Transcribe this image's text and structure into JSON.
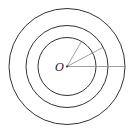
{
  "diagram": {
    "title": "",
    "center_label": "O",
    "center": {
      "x": 67,
      "y": 66.5
    },
    "circles": [
      {
        "name": "inner",
        "r": 29
      },
      {
        "name": "middle",
        "r": 41
      },
      {
        "name": "outer",
        "r": 58
      }
    ],
    "radii": [
      {
        "to": "inner",
        "angle_deg": 60
      },
      {
        "to": "middle",
        "angle_deg": 28
      },
      {
        "to": "outer",
        "angle_deg": 0
      }
    ],
    "colors": {
      "circle": "#333333",
      "radius": "#888888"
    }
  }
}
